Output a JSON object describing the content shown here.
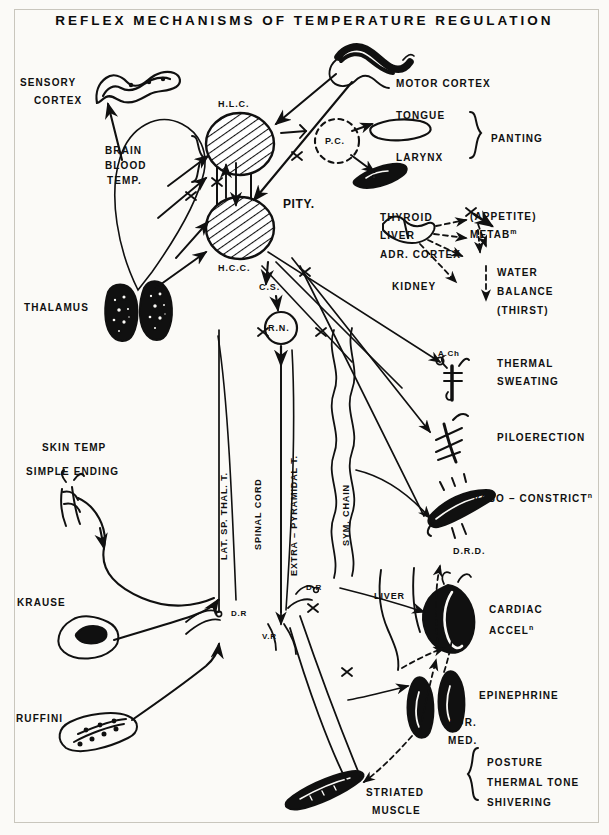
{
  "figure": {
    "title": "REFLEX  MECHANISMS  OF  TEMPERATURE  REGULATION",
    "ink_color": "#101010",
    "paper_color": "#fbfaf7"
  },
  "labels": {
    "sensory_cortex_l1": "SENSORY",
    "sensory_cortex_l2": "CORTEX",
    "motor_cortex": "MOTOR CORTEX",
    "hlc": "H.L.C.",
    "hcc": "H.C.C.",
    "pc": "P.C.",
    "pity": "PITY.",
    "brain_blood_l1": "BRAIN",
    "brain_blood_l2": "BLOOD",
    "brain_blood_l3": "TEMP.",
    "tongue": "TONGUE",
    "larynx": "LARYNX",
    "panting": "PANTING",
    "thyroid": "THYROID",
    "liver_top": "LIVER",
    "adr_cortex": "ADR. CORTEX",
    "kidney": "KIDNEY",
    "appetite": "(APPETITE)",
    "metab": "METAB",
    "metab_sup": "m",
    "water_l1": "WATER",
    "water_l2": "BALANCE",
    "water_l3": "(THIRST)",
    "thalamus": "THALAMUS",
    "cs": "C.S.",
    "rn": "R.N.",
    "ach": "A.Ch",
    "thermal_l1": "THERMAL",
    "thermal_l2": "SWEATING",
    "piloerection": "PILOERECTION",
    "vaso": "VASO – CONSTRICT",
    "vaso_sup": "n",
    "drd": "D.R.D.",
    "skin_temp": "SKIN TEMP",
    "simple_ending": "SIMPLE ENDING",
    "krause": "KRAUSE",
    "ruffini": "RUFFINI",
    "lat_sp_thal": "LAT. SP. THAL. T.",
    "spinal_cord": "SPINAL  CORD",
    "extra_pyramidal": "EXTRA – PYRAMIDAL T.",
    "sym_chain": "SYM. CHAIN",
    "dr_left": "D.R",
    "dr_mid": "D.R",
    "vr": "V.R",
    "liver_low": "LIVER",
    "cardiac_l1": "CARDIAC",
    "cardiac_l2": "ACCEL",
    "cardiac_sup": "n",
    "epinephrine": "EPINEPHRINE",
    "adr_med_l1": "ADR.",
    "adr_med_l2": "MED.",
    "striated_l1": "STRIATED",
    "striated_l2": "MUSCLE",
    "posture": "POSTURE",
    "thermal_tone": "THERMAL TONE",
    "shivering": "SHIVERING"
  }
}
